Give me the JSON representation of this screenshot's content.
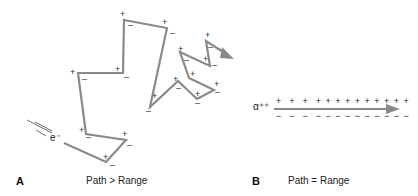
{
  "panels": [
    {
      "letter": "A",
      "caption": "Path > Range",
      "particle": "e⁻"
    },
    {
      "letter": "B",
      "caption": "Path = Range",
      "particle": "α⁺⁺"
    }
  ],
  "colors": {
    "path": "#8a8a8a",
    "text": "#222222"
  },
  "panel_a": {
    "path_points": [
      [
        64,
        143
      ],
      [
        106,
        162
      ],
      [
        126,
        140
      ],
      [
        86,
        134
      ],
      [
        78,
        73
      ],
      [
        123,
        73
      ],
      [
        124,
        20
      ],
      [
        167,
        28
      ],
      [
        150,
        107
      ],
      [
        178,
        81
      ],
      [
        197,
        99
      ],
      [
        214,
        90
      ],
      [
        189,
        78
      ],
      [
        180,
        52
      ],
      [
        210,
        66
      ],
      [
        206,
        41
      ],
      [
        232,
        57
      ]
    ]
  },
  "panel_b": {
    "plus_signs": "+  +  +  + + + + + + + + + +",
    "minus_signs": "−  −  −  − − − − − − − − − −"
  }
}
